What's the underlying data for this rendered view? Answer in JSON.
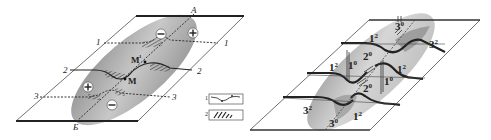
{
  "left_diagram": {
    "top_label": "А",
    "bottom_label": "Б",
    "section_labels": [
      {
        "id": "1",
        "left": "1",
        "right": "1"
      },
      {
        "id": "2",
        "left": "2",
        "right": "2"
      },
      {
        "id": "3",
        "left": "3",
        "right": "3"
      }
    ],
    "point_labels": {
      "m1": "M",
      "m1_sup": "1",
      "m": "M"
    },
    "signs": {
      "plus": "+",
      "minus": "−"
    },
    "legend": [
      {
        "num": "1",
        "type": "fault-line-symbol"
      },
      {
        "num": "2",
        "type": "hatched-zone-symbol"
      }
    ]
  },
  "right_diagram": {
    "labels": [
      {
        "base": "3",
        "sup": "0",
        "pos": "top"
      },
      {
        "base": "1",
        "sup": "2",
        "pos": "upper-left"
      },
      {
        "base": "3",
        "sup": "2",
        "pos": "upper-right"
      },
      {
        "base": "1",
        "sup": "2",
        "pos": "mid-left"
      },
      {
        "base": "1",
        "sup": "0",
        "pos": "center-left"
      },
      {
        "base": "2",
        "sup": "0",
        "pos": "center-top"
      },
      {
        "base": "1",
        "sup": "2",
        "pos": "mid-right"
      },
      {
        "base": "1",
        "sup": "0",
        "pos": "center-right"
      },
      {
        "base": "2",
        "sup": "0",
        "pos": "center-bottom"
      },
      {
        "base": "3",
        "sup": "2",
        "pos": "lower-left"
      },
      {
        "base": "1",
        "sup": "2",
        "pos": "lower-right"
      },
      {
        "base": "3",
        "sup": "0",
        "pos": "bottom"
      }
    ]
  },
  "colors": {
    "ellipse_dark": "#7a7a7a",
    "ellipse_light": "#d4d4d4",
    "line": "#222222",
    "background": "#ffffff"
  }
}
